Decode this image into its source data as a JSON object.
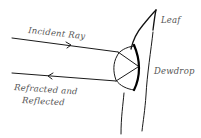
{
  "diagram": {
    "labels": {
      "leaf": "Leaf",
      "dewdrop": "Dewdrop",
      "incident_ray": "Incident Ray",
      "outgoing_line1": "Refracted and",
      "outgoing_line2": "Reflected"
    },
    "elements": [
      {
        "name": "leaf",
        "type": "outline"
      },
      {
        "name": "dewdrop",
        "type": "hemisphere"
      },
      {
        "name": "incident-ray",
        "direction": "right",
        "arrow": true
      },
      {
        "name": "internal-refraction-path",
        "segments": 2
      },
      {
        "name": "refracted-reflected-ray",
        "direction": "left",
        "arrow": true
      }
    ],
    "colors": {
      "line": "#111111",
      "text": "#555555",
      "background": "#ffffff"
    }
  }
}
